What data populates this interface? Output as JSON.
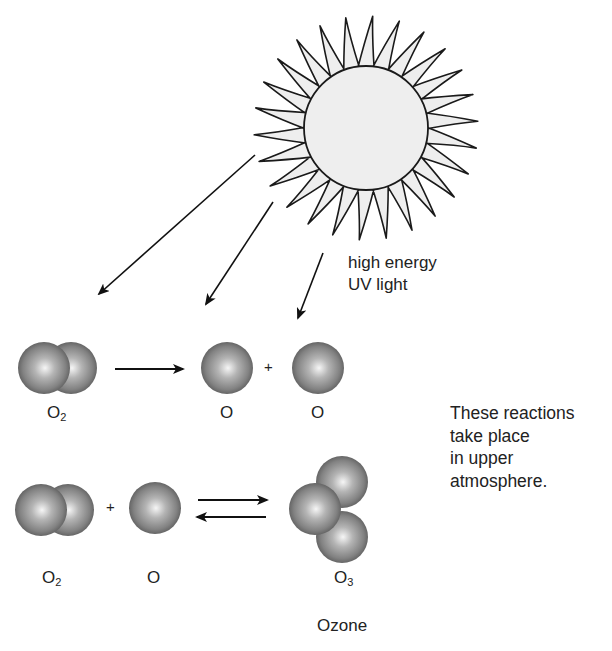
{
  "figure": {
    "sun": {
      "label": "sun",
      "fill": "#eeeeee",
      "stroke": "#1a1a1a"
    },
    "uv_label": {
      "line1": "high energy",
      "line2": "UV light"
    },
    "reaction1": {
      "reactant": {
        "symbol": "O",
        "subscript": "2"
      },
      "products": [
        {
          "symbol": "O"
        },
        {
          "symbol": "O"
        }
      ],
      "plus": "+"
    },
    "reaction2": {
      "reactants": [
        {
          "symbol": "O",
          "subscript": "2"
        },
        {
          "symbol": "O"
        }
      ],
      "product": {
        "symbol": "O",
        "subscript": "3",
        "name": "Ozone"
      },
      "plus": "+"
    },
    "note": {
      "lines": [
        "These reactions",
        "take place",
        "in upper",
        "atmosphere."
      ]
    },
    "colors": {
      "atom_highlight": "#f4f4f4",
      "atom_mid": "#a8a8a8",
      "atom_edge": "#555555",
      "line": "#111111"
    }
  }
}
